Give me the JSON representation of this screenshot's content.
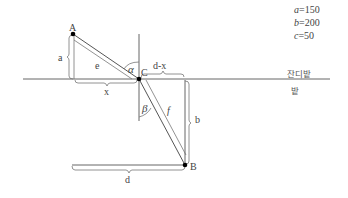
{
  "params": [
    {
      "var": "a",
      "eq": "=150"
    },
    {
      "var": "b",
      "eq": "=200"
    },
    {
      "var": "c",
      "eq": "=50"
    }
  ],
  "regions": {
    "upper": "잔디밭",
    "lower": "밭"
  },
  "points": {
    "A": "A",
    "B": "B",
    "C": "C"
  },
  "segments": {
    "a": "a",
    "b": "b",
    "d": "d",
    "d_minus_x": "d-x",
    "x": "x",
    "e": "e",
    "f": "f"
  },
  "angles": {
    "alpha": "α",
    "beta": "β"
  },
  "colors": {
    "line": "#555555",
    "point": "#000000",
    "background": "#ffffff"
  }
}
